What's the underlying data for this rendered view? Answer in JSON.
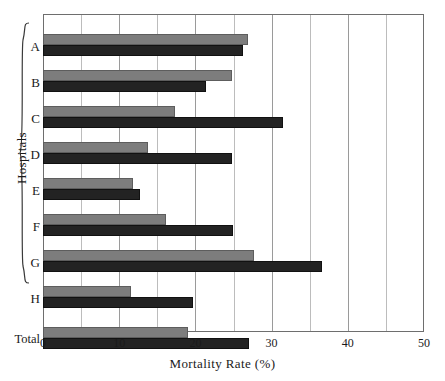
{
  "chart_data": {
    "type": "bar",
    "orientation": "horizontal",
    "title": "",
    "xlabel": "Mortality Rate (%)",
    "ylabel": "Hospitals",
    "xlim": [
      0,
      50
    ],
    "xticks": [
      0,
      10,
      20,
      30,
      40,
      50
    ],
    "xtick_labels": [
      "0",
      "10",
      "20",
      "30",
      "40",
      "50"
    ],
    "minor_tick_interval": 5,
    "grid": true,
    "grid_axis": "x",
    "legend": null,
    "categories": [
      "A",
      "B",
      "C",
      "D",
      "E",
      "F",
      "G",
      "H",
      "Total"
    ],
    "group_bracket_label": "Hospitals",
    "group_bracket_categories": [
      "A",
      "B",
      "C",
      "D",
      "E",
      "F",
      "G",
      "H"
    ],
    "series": [
      {
        "name": "series-gray",
        "color": "#7d7d7d",
        "values": [
          26.9,
          24.8,
          17.3,
          13.8,
          11.8,
          16.1,
          27.7,
          11.5,
          19.0
        ]
      },
      {
        "name": "series-dark",
        "color": "#232323",
        "values": [
          26.2,
          21.4,
          31.5,
          24.8,
          12.7,
          24.9,
          36.6,
          19.7,
          27.0
        ]
      }
    ]
  },
  "axis": {
    "x_title": "Mortality Rate (%)",
    "y_title": "Hospitals"
  },
  "colors": {
    "series_gray": "#7d7d7d",
    "series_dark": "#232323",
    "frame": "#6e6e6e",
    "grid_major": "#9a9a9a",
    "grid_minor": "#bcbcbc",
    "background": "#ffffff"
  }
}
